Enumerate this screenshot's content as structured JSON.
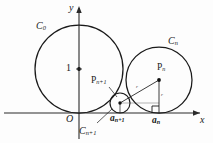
{
  "figure": {
    "kind": "geometry-diagram",
    "stroke_color": "#1a1a1a",
    "axis_color": "#2a2a2a",
    "background": "#fdfdfd",
    "width": 213,
    "height": 143
  },
  "axes": {
    "x_label": "x",
    "y_label": "y",
    "origin_label": "O",
    "unit_tick_label": "1",
    "x_axis_y": 113,
    "y_axis_x": 79
  },
  "circles": [
    {
      "id": "C0",
      "label": "C",
      "sub": "0",
      "cx": 79,
      "cy": 69,
      "r": 44,
      "label_x": 36,
      "label_y": 21
    },
    {
      "id": "Cn",
      "label": "C",
      "sub": "n",
      "cx": 159,
      "cy": 80,
      "r": 33,
      "label_x": 168,
      "label_y": 36
    },
    {
      "id": "Cn1",
      "label": "C",
      "sub": "n+1",
      "cx": 120,
      "cy": 103,
      "r": 10,
      "label_x": 79,
      "label_y": 126
    }
  ],
  "points": [
    {
      "id": "Pn",
      "label": "P",
      "sub": "n",
      "cx": 159,
      "cy": 80,
      "label_x": 157,
      "label_y": 64
    },
    {
      "id": "Pn1",
      "label": "P",
      "sub": "n+1",
      "cx": 120,
      "cy": 103,
      "label_x": 91,
      "label_y": 76
    },
    {
      "id": "center0",
      "label": "1",
      "cx": 79,
      "cy": 69,
      "label_x": 66,
      "label_y": 64
    }
  ],
  "foot_labels": [
    {
      "id": "a_n_plus_1",
      "label": "a",
      "sub": "n+1",
      "x": 110,
      "y": 115
    },
    {
      "id": "a_n",
      "label": "a",
      "sub": "n",
      "x": 152,
      "y": 117
    }
  ],
  "segment_labels": [
    {
      "id": "hypotenuse-label",
      "text": "r",
      "x": 136,
      "y": 86
    },
    {
      "id": "vertical-label",
      "text": "r",
      "x": 161,
      "y": 94
    }
  ],
  "markers": {
    "right_angle": {
      "x": 159,
      "y": 113,
      "size": 7
    },
    "leader_line_Cn1": {
      "x1": 97,
      "y1": 123,
      "x2": 111,
      "y2": 110
    },
    "leader_line_Pn1": {
      "x1": 110,
      "y1": 86,
      "x2": 118,
      "y2": 97
    }
  }
}
